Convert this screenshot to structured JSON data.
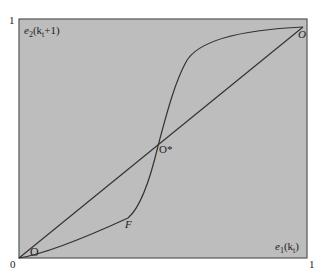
{
  "diagram": {
    "type": "phase-diagram",
    "background_color": "#bdbdbd",
    "line_color": "#333333",
    "frame": {
      "left": 19,
      "top": 19,
      "right": 307,
      "bottom": 258
    },
    "axes": {
      "y_label_base": "e",
      "y_label_sub": "2",
      "y_label_arg": "(k",
      "y_label_arg_sub": "t",
      "y_label_arg_end": "+1)",
      "x_label_base": "e",
      "x_label_sub": "1",
      "x_label_arg": "(k",
      "x_label_arg_sub": "t",
      "x_label_arg_end": ")",
      "origin_tick": "0",
      "x_max_tick": "1",
      "y_max_tick": "1"
    },
    "points": {
      "origin_point": "O",
      "fixed_point": "O*",
      "kink_point": "F",
      "upper_point": "O"
    }
  }
}
